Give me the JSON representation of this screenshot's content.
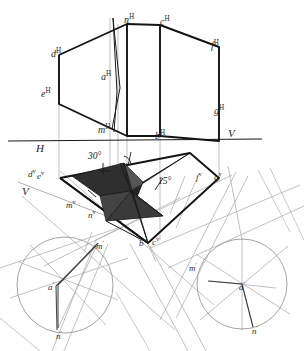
{
  "figure": {
    "domain": "technical-line-drawing",
    "canvas": {
      "width": 304,
      "height": 351,
      "background": "#ffffff"
    },
    "ink": {
      "primary": "#1a1a1a",
      "light": "#9a9a9a",
      "fill_dark": "#2e2e2e",
      "fill_mid": "#4a4a4a"
    }
  },
  "axes": {
    "ground_line_label_left": "H",
    "ground_line_label_right": "V",
    "secondary_axis_label": "V"
  },
  "angles": [
    {
      "id": "angle-30",
      "value": "30°"
    },
    {
      "id": "angle-15",
      "value": "15°"
    }
  ],
  "labels_elevation": [
    {
      "id": "n-elev",
      "base": "n",
      "sup": "H",
      "x": 124,
      "y": 14
    },
    {
      "id": "c-elev",
      "base": "c",
      "sup": "H",
      "x": 160,
      "y": 16
    },
    {
      "id": "f-elev",
      "base": "f",
      "sup": "H",
      "x": 211,
      "y": 40
    },
    {
      "id": "d-elev",
      "base": "d",
      "sup": "H",
      "x": 51,
      "y": 48
    },
    {
      "id": "a-elev",
      "base": "a",
      "sup": "H",
      "x": 101,
      "y": 71
    },
    {
      "id": "e-elev",
      "base": "e",
      "sup": "H",
      "x": 41,
      "y": 88
    },
    {
      "id": "g-elev",
      "base": "g",
      "sup": "H",
      "x": 214,
      "y": 105
    },
    {
      "id": "m-elev",
      "base": "m",
      "sup": "H",
      "x": 98,
      "y": 124
    },
    {
      "id": "b-elev",
      "base": "b",
      "sup": "H",
      "x": 155,
      "y": 130
    }
  ],
  "labels_plan": [
    {
      "id": "d-plan",
      "base": "d",
      "sup": "v",
      "x": 28,
      "y": 168
    },
    {
      "id": "e-plan",
      "base": "e",
      "sup": "v",
      "x": 37,
      "y": 170
    },
    {
      "id": "a-plan",
      "base": "a",
      "sup": "v",
      "x": 121,
      "y": 161
    },
    {
      "id": "f-plan",
      "base": "f",
      "sup": "v",
      "x": 196,
      "y": 171
    },
    {
      "id": "g-plan",
      "base": "g",
      "sup": "v",
      "x": 214,
      "y": 171
    },
    {
      "id": "m-plan",
      "base": "m",
      "sup": "v",
      "x": 66,
      "y": 199
    },
    {
      "id": "n-plan",
      "base": "n",
      "sup": "v",
      "x": 88,
      "y": 209
    },
    {
      "id": "b-plan",
      "base": "b",
      "sup": "v",
      "x": 139,
      "y": 237
    },
    {
      "id": "c-plan",
      "base": "c",
      "sup": "v",
      "x": 152,
      "y": 236
    }
  ],
  "labels_rotated_left": [
    {
      "id": "m-rot-left",
      "base": "m",
      "sup": "'",
      "x": 96,
      "y": 240
    },
    {
      "id": "a-rot-left",
      "base": "a",
      "sup": "'",
      "x": 48,
      "y": 281
    },
    {
      "id": "n-rot-left",
      "base": "n",
      "sup": "'",
      "x": 56,
      "y": 330
    }
  ],
  "labels_rotated_right": [
    {
      "id": "m-rot-right",
      "base": "m",
      "sup": "'",
      "x": 189,
      "y": 262
    },
    {
      "id": "a-rot-right",
      "base": "a",
      "sup": "'",
      "x": 239,
      "y": 281
    },
    {
      "id": "n-rot-right",
      "base": "n",
      "sup": "'",
      "x": 252,
      "y": 325
    }
  ],
  "circles": [
    {
      "id": "rotation-circle-left",
      "cx": 65,
      "cy": 285,
      "r": 48
    },
    {
      "id": "rotation-circle-right",
      "cx": 242,
      "cy": 284,
      "r": 45
    }
  ],
  "shaded_polygons": [
    {
      "id": "triangle-left-wing",
      "points": "72,175 122,165 130,190 100,196"
    },
    {
      "id": "triangle-right-wing",
      "points": "130,190 190,155 140,185 136,196"
    },
    {
      "id": "triangle-lower-wing",
      "points": "130,190 160,215 104,222"
    }
  ]
}
